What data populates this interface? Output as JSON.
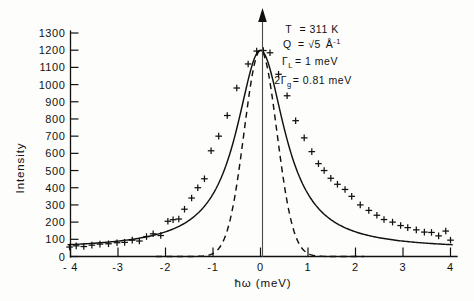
{
  "chart_data": {
    "type": "scatter",
    "title": "",
    "xlabel": "ħω (meV)",
    "ylabel": "Intensity",
    "xlim": [
      -4.35,
      4.35
    ],
    "ylim": [
      0,
      1300
    ],
    "grid": false,
    "legend_position": "none",
    "xticks": [
      -4,
      -3,
      -2,
      -1,
      0,
      1,
      2,
      3,
      4
    ],
    "xtick_labels": [
      "- 4",
      "-3",
      "-2",
      "-1",
      "0",
      "1",
      "2",
      "3",
      "4"
    ],
    "yticks": [
      0,
      100,
      200,
      300,
      400,
      500,
      600,
      700,
      800,
      900,
      1000,
      1100,
      1200,
      1300
    ],
    "ytick_labels": [
      "0",
      "100",
      "200",
      "300",
      "400",
      "500",
      "600",
      "700",
      "800",
      "900",
      "1000",
      "1100",
      "1200",
      "1300"
    ],
    "annotations": [
      {
        "id": "temperature",
        "text": "T = 311 K"
      },
      {
        "id": "momentum-transfer",
        "text": "Q = √5 Å⁻¹"
      },
      {
        "id": "lorentzian-width",
        "text": "Γʟ = 1 meV"
      },
      {
        "id": "gaussian-width",
        "text": "2Γg = 0.81 meV"
      }
    ],
    "annotation_parts": {
      "line1_label": "T",
      "line1_eq": "=",
      "line1_value": "311 K",
      "line2_label": "Q",
      "line2_eq": "=",
      "line2_value": "√5",
      "line2_unit": "Å",
      "line2_unit_exp": "-1",
      "line3_label": "Γ",
      "line3_sub": "L",
      "line3_eq": "=",
      "line3_value": "1 meV",
      "line4_prefix": "2Γ",
      "line4_sub": "g",
      "line4_eq": "=",
      "line4_value": "0.81 meV"
    },
    "series": [
      {
        "name": "measured-intensity",
        "type": "scatter",
        "marker": "plus",
        "points": [
          {
            "x": -4.02,
            "y": 55
          },
          {
            "x": -3.88,
            "y": 62
          },
          {
            "x": -3.72,
            "y": 58
          },
          {
            "x": -3.55,
            "y": 66
          },
          {
            "x": -3.38,
            "y": 72
          },
          {
            "x": -3.2,
            "y": 74
          },
          {
            "x": -3.02,
            "y": 80
          },
          {
            "x": -2.86,
            "y": 82
          },
          {
            "x": -2.7,
            "y": 95
          },
          {
            "x": -2.55,
            "y": 90
          },
          {
            "x": -2.4,
            "y": 116
          },
          {
            "x": -2.26,
            "y": 132
          },
          {
            "x": -2.1,
            "y": 122
          },
          {
            "x": -1.95,
            "y": 205
          },
          {
            "x": -1.84,
            "y": 214
          },
          {
            "x": -1.72,
            "y": 218
          },
          {
            "x": -1.6,
            "y": 275
          },
          {
            "x": -1.45,
            "y": 340
          },
          {
            "x": -1.32,
            "y": 400
          },
          {
            "x": -1.18,
            "y": 452
          },
          {
            "x": -1.04,
            "y": 615
          },
          {
            "x": -0.88,
            "y": 700
          },
          {
            "x": -0.7,
            "y": 820
          },
          {
            "x": -0.5,
            "y": 980
          },
          {
            "x": -0.26,
            "y": 1120
          },
          {
            "x": -0.08,
            "y": 1195
          },
          {
            "x": 0.06,
            "y": 1198
          },
          {
            "x": 0.2,
            "y": 1185
          },
          {
            "x": 0.38,
            "y": 1060
          },
          {
            "x": 0.56,
            "y": 935
          },
          {
            "x": 0.74,
            "y": 790
          },
          {
            "x": 0.92,
            "y": 690
          },
          {
            "x": 1.08,
            "y": 610
          },
          {
            "x": 1.22,
            "y": 540
          },
          {
            "x": 1.34,
            "y": 500
          },
          {
            "x": 1.48,
            "y": 455
          },
          {
            "x": 1.62,
            "y": 420
          },
          {
            "x": 1.78,
            "y": 390
          },
          {
            "x": 1.92,
            "y": 350
          },
          {
            "x": 2.1,
            "y": 300
          },
          {
            "x": 2.28,
            "y": 268
          },
          {
            "x": 2.45,
            "y": 240
          },
          {
            "x": 2.6,
            "y": 215
          },
          {
            "x": 2.78,
            "y": 200
          },
          {
            "x": 2.95,
            "y": 180
          },
          {
            "x": 3.1,
            "y": 168
          },
          {
            "x": 3.28,
            "y": 155
          },
          {
            "x": 3.45,
            "y": 142
          },
          {
            "x": 3.6,
            "y": 140
          },
          {
            "x": 3.75,
            "y": 120
          },
          {
            "x": 3.9,
            "y": 148
          },
          {
            "x": 4.0,
            "y": 95
          }
        ]
      },
      {
        "name": "lorentzian-fit",
        "type": "line",
        "style": "solid",
        "description": "Lorentzian convolved fit, FWHM 1 meV",
        "peak": 1200,
        "center": 0.0,
        "hwhm": 0.62,
        "baseline": 42
      },
      {
        "name": "gaussian-resolution",
        "type": "line",
        "style": "dashed",
        "description": "Gaussian instrumental resolution, FWHM 0.81 meV",
        "peak": 1200,
        "center": 0.0,
        "fwhm": 0.81,
        "baseline": 0
      }
    ]
  },
  "figure": {
    "center_marker": "elastic-position-arrow"
  }
}
